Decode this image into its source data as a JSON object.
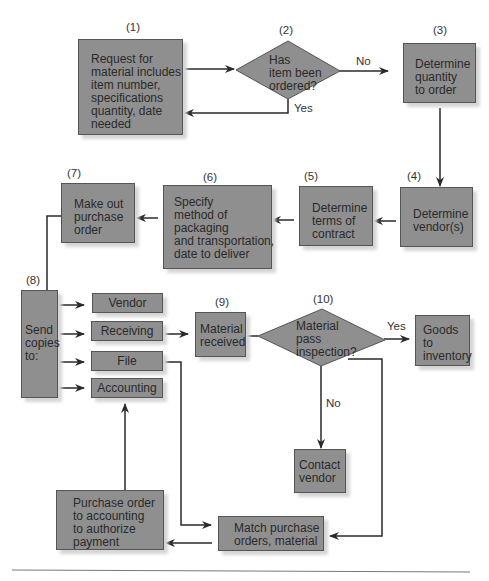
{
  "diagram": {
    "type": "flowchart",
    "steps": [
      {
        "id": "1",
        "num": "(1)",
        "kind": "process",
        "text": "Request for\nmaterial includes\nitem number,\nspecifications\nquantity, date\nneeded"
      },
      {
        "id": "2",
        "num": "(2)",
        "kind": "decision",
        "text": "Has\nitem been\nordered?"
      },
      {
        "id": "3",
        "num": "(3)",
        "kind": "process",
        "text": "Determine\nquantity\nto order"
      },
      {
        "id": "4",
        "num": "(4)",
        "kind": "process",
        "text": "Determine\nvendor(s)"
      },
      {
        "id": "5",
        "num": "(5)",
        "kind": "process",
        "text": "Determine\nterms of\ncontract"
      },
      {
        "id": "6",
        "num": "(6)",
        "kind": "process",
        "text": "Specify\nmethod of\npackaging\nand transportation,\ndate to deliver"
      },
      {
        "id": "7",
        "num": "(7)",
        "kind": "process",
        "text": "Make out\npurchase\norder"
      },
      {
        "id": "8",
        "num": "(8)",
        "kind": "process",
        "text": "Send\ncopies\nto:"
      },
      {
        "id": "9",
        "num": "(9)",
        "kind": "process",
        "text": "Material\nreceived"
      },
      {
        "id": "10",
        "num": "(10)",
        "kind": "decision",
        "text": "Material\npass\ninspection?"
      }
    ],
    "copies": [
      "Vendor",
      "Receiving",
      "File",
      "Accounting"
    ],
    "other_nodes": {
      "goods_to_inventory": "Goods\nto\ninventory",
      "contact_vendor": "Contact\nvendor",
      "match_orders": "Match purchase\norders, material",
      "po_to_accounting": "Purchase order\nto accounting\nto authorize\npayment"
    },
    "edge_labels": {
      "d2_no": "No",
      "d2_yes": "Yes",
      "d10_yes": "Yes",
      "d10_no": "No"
    },
    "colors": {
      "box_fill": "#8f8f8f",
      "box_border": "#555555",
      "line": "#2a2a2a",
      "shadow": "#d6d6d6"
    }
  }
}
